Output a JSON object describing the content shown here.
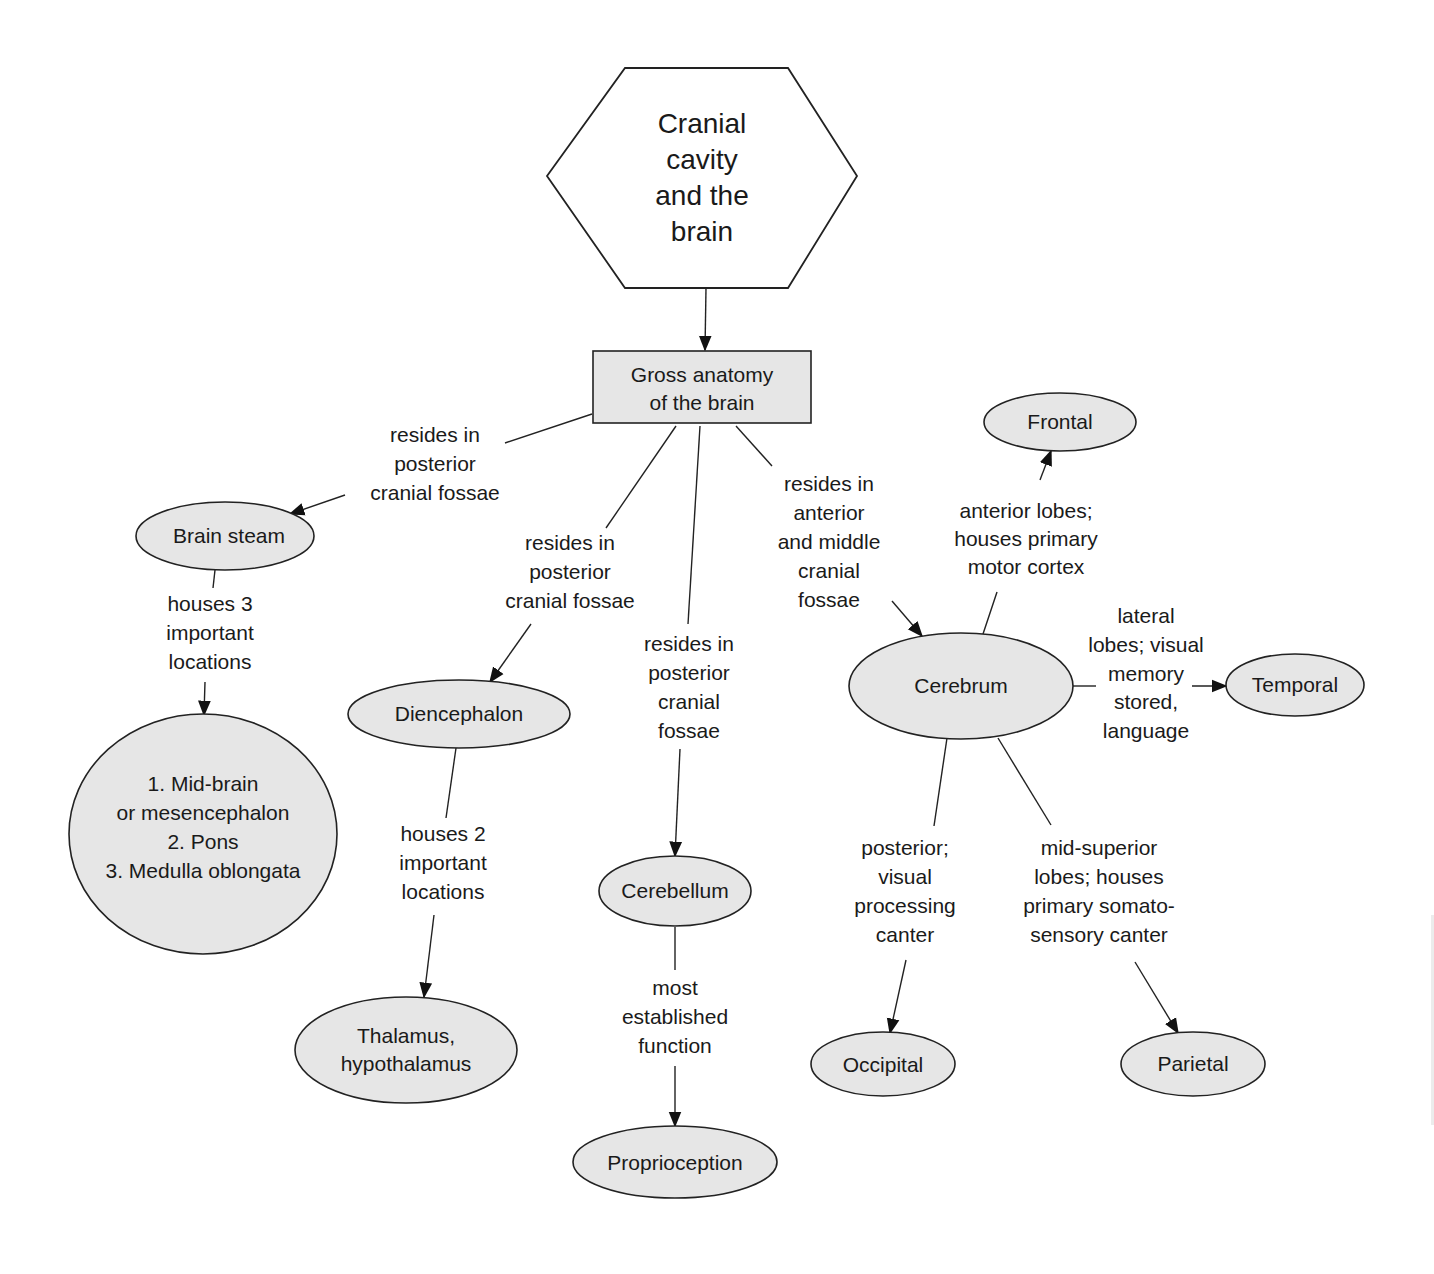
{
  "root": {
    "lines": [
      "Cranial",
      "cavity",
      "and the",
      "brain"
    ]
  },
  "main": {
    "lines": [
      "Gross anatomy",
      "of the brain"
    ]
  },
  "nodes": {
    "brain_stem": "Brain steam",
    "brain_stem_parts": [
      "1. Mid-brain",
      "or mesencephalon",
      "2. Pons",
      "3. Medulla oblongata"
    ],
    "diencephalon": "Diencephalon",
    "thalamus": [
      "Thalamus,",
      "hypothalamus"
    ],
    "cerebellum": "Cerebellum",
    "proprioception": "Proprioception",
    "cerebrum": "Cerebrum",
    "frontal": "Frontal",
    "temporal": "Temporal",
    "occipital": "Occipital",
    "parietal": "Parietal"
  },
  "links": {
    "to_brain_stem": [
      "resides in",
      "posterior",
      "cranial fossae"
    ],
    "to_diencephalon": [
      "resides in",
      "posterior",
      "cranial fossae"
    ],
    "to_cerebellum": [
      "resides in",
      "posterior",
      "cranial",
      "fossae"
    ],
    "to_cerebrum": [
      "resides in",
      "anterior",
      "and middle",
      "cranial",
      "fossae"
    ],
    "brain_stem_houses": [
      "houses 3",
      "important",
      "locations"
    ],
    "diencephalon_houses": [
      "houses 2",
      "important",
      "locations"
    ],
    "cerebellum_function": [
      "most",
      "established",
      "function"
    ],
    "to_frontal": [
      "anterior lobes;",
      "houses primary",
      "motor cortex"
    ],
    "to_temporal": [
      "lateral",
      "lobes; visual",
      "memory",
      "stored,",
      "language"
    ],
    "to_occipital": [
      "posterior;",
      "visual",
      "processing",
      "canter"
    ],
    "to_parietal": [
      "mid-superior",
      "lobes; houses",
      "primary somato-",
      "sensory canter"
    ]
  }
}
